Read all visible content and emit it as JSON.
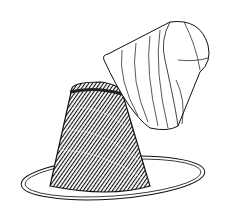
{
  "image": {
    "description": "Pen-and-ink illustration of a ribbed steamed pudding on a plate with its inverted pudding mold lifted above",
    "colors": {
      "ink": "#111111",
      "background": "#ffffff"
    }
  }
}
